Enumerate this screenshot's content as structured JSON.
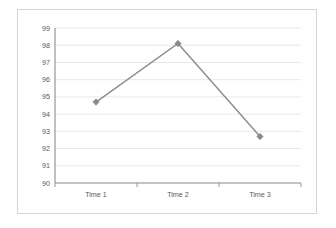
{
  "chart_data": {
    "type": "line",
    "title": "",
    "subtitle": "",
    "xlabel": "",
    "ylabel": "",
    "categories": [
      "Time 1",
      "Time 2",
      "Time 3"
    ],
    "values": [
      94.7,
      98.1,
      92.7
    ],
    "series": [
      {
        "name": "",
        "values": [
          94.7,
          98.1,
          92.7
        ]
      }
    ],
    "ylim": [
      90,
      99
    ],
    "ytick_labels": [
      "99",
      "98",
      "97",
      "96",
      "95",
      "94",
      "93",
      "92",
      "91",
      "90"
    ],
    "ytick_values": [
      99,
      98,
      97,
      96,
      95,
      94,
      93,
      92,
      91,
      90
    ],
    "xtick_labels": [
      "Time 1",
      "Time 2",
      "Time 3"
    ],
    "grid": true,
    "grid_axis": "y",
    "legend": false,
    "legend_position": "none",
    "marker": "diamond",
    "colors": {
      "line": "#8e8e8e",
      "marker": "#8a8a8a",
      "gridline": "#e2e2e2",
      "axis": "#8c8c8c",
      "tick_text": "#5a5a5a",
      "plot_background": "#ffffff",
      "frame_border": "#d4d4d4"
    }
  }
}
